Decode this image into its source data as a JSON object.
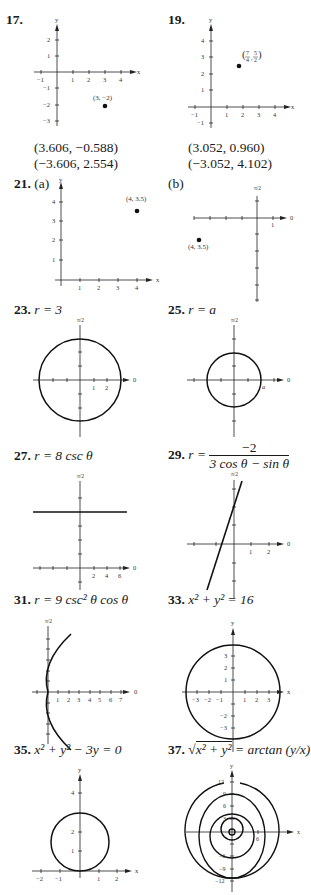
{
  "problems": [
    {
      "number": "17.",
      "type": "rect_point",
      "point_label": "(3, −2)",
      "answers": [
        "(3.606, −0.588)",
        "(−3.606, 2.554)"
      ],
      "x_ticks": [
        "−1",
        "1",
        "2",
        "3",
        "4"
      ],
      "y_ticks": [
        "2",
        "1",
        "−1",
        "−2",
        "−3"
      ],
      "x_label": "x",
      "y_label": "y"
    },
    {
      "number": "19.",
      "type": "rect_point",
      "point_label_num1": "7",
      "point_label_den1": "4",
      "point_label_num2": "5",
      "point_label_den2": "2",
      "answers": [
        "(3.052, 0.960)",
        "(−3.052, 4.102)"
      ],
      "x_ticks": [
        "−1",
        "1",
        "2",
        "3",
        "4"
      ],
      "y_ticks": [
        "4",
        "3",
        "2",
        "1",
        "−1"
      ],
      "x_label": "x",
      "y_label": "y"
    },
    {
      "number": "21.",
      "part_a": "(a)",
      "part_b": "(b)",
      "point_label_a": "(4, 3.5)",
      "point_label_b": "(4, 3.5)",
      "x_ticks_a": [
        "1",
        "2",
        "3",
        "4"
      ],
      "y_ticks_a": [
        "4",
        "3",
        "2",
        "1"
      ],
      "polar_tick_b": "1",
      "polar_zero": "0",
      "polar_half_pi": "π/2",
      "x_label": "x",
      "y_label": "y"
    },
    {
      "number": "23.",
      "equation": "r = 3",
      "ticks": [
        "1",
        "2"
      ],
      "polar_zero": "0",
      "polar_half_pi": "π/2"
    },
    {
      "number": "25.",
      "equation": "r = a",
      "radius_label": "a",
      "polar_zero": "0",
      "polar_half_pi": "π/2"
    },
    {
      "number": "27.",
      "equation": "r = 8 csc θ",
      "ticks": [
        "2",
        "4",
        "6"
      ],
      "polar_zero": "0",
      "polar_half_pi": "π/2"
    },
    {
      "number": "29.",
      "equation_lhs": "r =",
      "numerator": "−2",
      "denominator": "3 cos θ − sin θ",
      "ticks": [
        "1",
        "2"
      ],
      "polar_zero": "0",
      "polar_half_pi": "π/2"
    },
    {
      "number": "31.",
      "equation": "r = 9 csc² θ cos θ",
      "ticks": [
        "1",
        "2",
        "3",
        "4",
        "5",
        "6",
        "7"
      ],
      "polar_zero": "0",
      "polar_half_pi": "π/2"
    },
    {
      "number": "33.",
      "equation": "x² + y² = 16",
      "x_ticks": [
        "−3",
        "−2",
        "−1",
        "1",
        "2",
        "3"
      ],
      "y_ticks": [
        "3",
        "2",
        "1",
        "−2",
        "−3"
      ],
      "x_label": "x",
      "y_label": "y"
    },
    {
      "number": "35.",
      "equation": "x² + y² − 3y = 0",
      "x_ticks": [
        "−2",
        "−1",
        "1",
        "2"
      ],
      "y_ticks": [
        "4",
        "2",
        "1"
      ],
      "x_label": "x",
      "y_label": "y"
    },
    {
      "number": "37.",
      "equation_lhs": "√(x² + y²)",
      "equation_sqrt_inner": "x² + y²",
      "equation_rhs": "= arctan (y/x)",
      "y_ticks": [
        "12",
        "9",
        "6",
        "3",
        "−6",
        "−9",
        "−12"
      ],
      "x_tick": "6",
      "x_label": "x",
      "y_label": "y"
    }
  ]
}
